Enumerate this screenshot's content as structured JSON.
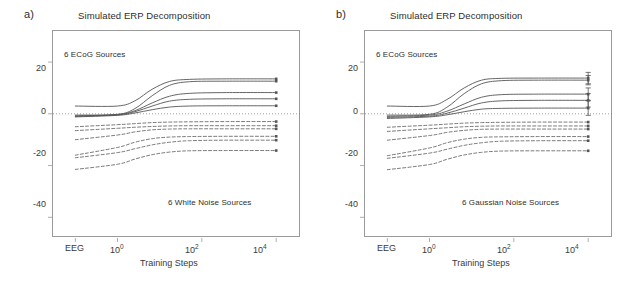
{
  "figure": {
    "panels": [
      {
        "label": "a)",
        "title": "Simulated ERP Decomposition",
        "annotation_top": "6 ECoG Sources",
        "annotation_bottom": "6 White Noise Sources",
        "error_bars": false
      },
      {
        "label": "b)",
        "title": "Simulated ERP Decomposition",
        "annotation_top": "6 ECoG Sources",
        "annotation_bottom": "6 Gaussian Noise Sources",
        "error_bars": true
      }
    ],
    "axes": {
      "yticks": [
        "20",
        "0",
        "-20",
        "-40"
      ],
      "ytick_values": [
        20,
        0,
        -20,
        -40
      ],
      "ylim": [
        -48,
        32
      ],
      "xlabel": "Training Steps",
      "xticks": [
        {
          "text": "EEG",
          "exp": ""
        },
        {
          "text": "10",
          "exp": "0"
        },
        {
          "text": "10",
          "exp": "2"
        },
        {
          "text": "10",
          "exp": "4"
        }
      ],
      "zero_line": "dotted"
    }
  },
  "chart_data": {
    "type": "line",
    "title": "Simulated ERP Decomposition",
    "xlabel": "Training Steps",
    "ylabel": "",
    "ylim": [
      -48,
      32
    ],
    "xlim": [
      0,
      1
    ],
    "grid": false,
    "legend": "none",
    "x_category_labels": [
      "EEG",
      "10^0",
      "10^2",
      "10^4"
    ],
    "x_category_positions": [
      0.09,
      0.26,
      0.6,
      0.9
    ],
    "panels": [
      {
        "name": "a",
        "annotation_top": "6 ECoG Sources",
        "annotation_bottom": "6 White Noise Sources",
        "error_bars": false,
        "series": [
          {
            "name": "ECoG 1",
            "style": "solid",
            "x": [
              0.09,
              0.26,
              0.33,
              0.4,
              0.47,
              0.55,
              0.7,
              0.9
            ],
            "values": [
              3.0,
              3.0,
              5.0,
              9.5,
              12.5,
              13.3,
              13.5,
              13.5
            ],
            "end_value": 13.5
          },
          {
            "name": "ECoG 2",
            "style": "solid",
            "x": [
              0.09,
              0.26,
              0.33,
              0.4,
              0.47,
              0.55,
              0.7,
              0.9
            ],
            "values": [
              -0.5,
              -0.2,
              2.0,
              7.0,
              11.0,
              12.4,
              12.6,
              12.6
            ],
            "end_value": 12.6
          },
          {
            "name": "ECoG 3",
            "style": "solid",
            "x": [
              0.09,
              0.26,
              0.33,
              0.4,
              0.47,
              0.55,
              0.7,
              0.9
            ],
            "values": [
              -0.8,
              -0.3,
              1.2,
              4.2,
              6.8,
              7.9,
              8.2,
              8.2
            ],
            "end_value": 8.2
          },
          {
            "name": "ECoG 4",
            "style": "solid",
            "x": [
              0.09,
              0.26,
              0.33,
              0.4,
              0.47,
              0.55,
              0.7,
              0.9
            ],
            "values": [
              -1.0,
              -0.4,
              0.8,
              3.0,
              4.9,
              5.6,
              5.8,
              5.8
            ],
            "end_value": 5.8
          },
          {
            "name": "ECoG 5",
            "style": "solid",
            "x": [
              0.09,
              0.26,
              0.33,
              0.4,
              0.47,
              0.55,
              0.7,
              0.9
            ],
            "values": [
              -1.2,
              -0.6,
              0.3,
              1.6,
              2.6,
              3.0,
              3.1,
              3.1
            ],
            "end_value": 3.1
          },
          {
            "name": "Noise 1",
            "style": "dashed",
            "x": [
              0.09,
              0.26,
              0.33,
              0.4,
              0.47,
              0.55,
              0.7,
              0.9
            ],
            "values": [
              -5.0,
              -4.2,
              -3.8,
              -3.4,
              -3.2,
              -3.1,
              -3.0,
              -3.0
            ],
            "end_value": -3.0
          },
          {
            "name": "Noise 2",
            "style": "dashed",
            "x": [
              0.09,
              0.26,
              0.33,
              0.4,
              0.47,
              0.55,
              0.7,
              0.9
            ],
            "values": [
              -6.5,
              -5.6,
              -5.2,
              -4.9,
              -4.7,
              -4.6,
              -4.6,
              -4.6
            ],
            "end_value": -4.6
          },
          {
            "name": "Noise 3",
            "style": "dashed",
            "x": [
              0.09,
              0.26,
              0.33,
              0.4,
              0.47,
              0.55,
              0.7,
              0.9
            ],
            "values": [
              -10.0,
              -8.2,
              -7.0,
              -6.2,
              -5.9,
              -5.8,
              -5.8,
              -5.8
            ],
            "end_value": -5.8
          },
          {
            "name": "Noise 4",
            "style": "dashed",
            "x": [
              0.09,
              0.26,
              0.33,
              0.4,
              0.47,
              0.55,
              0.7,
              0.9
            ],
            "values": [
              -16.0,
              -13.0,
              -11.0,
              -9.6,
              -9.0,
              -8.8,
              -8.7,
              -8.7
            ],
            "end_value": -8.7
          },
          {
            "name": "Noise 5",
            "style": "dashed",
            "x": [
              0.09,
              0.26,
              0.33,
              0.4,
              0.47,
              0.55,
              0.7,
              0.9
            ],
            "values": [
              -17.0,
              -15.0,
              -13.5,
              -12.0,
              -11.0,
              -10.4,
              -10.2,
              -10.2
            ],
            "end_value": -10.2
          },
          {
            "name": "Noise 6",
            "style": "dashed",
            "x": [
              0.09,
              0.26,
              0.33,
              0.4,
              0.47,
              0.55,
              0.7,
              0.9
            ],
            "values": [
              -21.5,
              -19.5,
              -17.5,
              -15.8,
              -14.8,
              -14.3,
              -14.2,
              -14.2
            ],
            "end_value": -14.2
          }
        ]
      },
      {
        "name": "b",
        "annotation_top": "6 ECoG Sources",
        "annotation_bottom": "6 Gaussian Noise Sources",
        "error_bars": true,
        "series": [
          {
            "name": "ECoG 1",
            "style": "solid",
            "x": [
              0.09,
              0.26,
              0.33,
              0.4,
              0.47,
              0.55,
              0.7,
              0.9
            ],
            "values": [
              3.0,
              3.0,
              5.5,
              10.0,
              13.0,
              13.7,
              13.8,
              13.8
            ],
            "end_value": 13.8,
            "err": 2.2
          },
          {
            "name": "ECoG 2",
            "style": "solid",
            "x": [
              0.09,
              0.26,
              0.33,
              0.4,
              0.47,
              0.55,
              0.7,
              0.9
            ],
            "values": [
              -0.5,
              -0.2,
              2.5,
              7.8,
              11.6,
              12.8,
              13.0,
              13.0
            ],
            "end_value": 13.0,
            "err": 1.8
          },
          {
            "name": "ECoG 3",
            "style": "solid",
            "x": [
              0.09,
              0.26,
              0.33,
              0.4,
              0.47,
              0.55,
              0.7,
              0.9
            ],
            "values": [
              -1.0,
              -0.5,
              1.0,
              3.8,
              6.4,
              7.4,
              7.6,
              7.6
            ],
            "end_value": 7.6,
            "err": 2.4
          },
          {
            "name": "ECoG 4",
            "style": "solid",
            "x": [
              0.09,
              0.26,
              0.33,
              0.4,
              0.47,
              0.55,
              0.7,
              0.9
            ],
            "values": [
              -1.4,
              -0.9,
              0.2,
              2.2,
              4.2,
              5.0,
              5.2,
              5.2
            ],
            "end_value": 5.2,
            "err": 2.6
          },
          {
            "name": "ECoG 5",
            "style": "solid",
            "x": [
              0.09,
              0.26,
              0.33,
              0.4,
              0.47,
              0.55,
              0.7,
              0.9
            ],
            "values": [
              -1.8,
              -1.2,
              -0.4,
              0.8,
              1.8,
              2.1,
              2.2,
              2.2
            ],
            "end_value": 2.2,
            "err": 2.8
          },
          {
            "name": "Noise 1",
            "style": "dashed",
            "x": [
              0.09,
              0.26,
              0.33,
              0.4,
              0.47,
              0.55,
              0.7,
              0.9
            ],
            "values": [
              -5.2,
              -4.4,
              -4.0,
              -3.6,
              -3.4,
              -3.3,
              -3.2,
              -3.2
            ],
            "end_value": -3.2
          },
          {
            "name": "Noise 2",
            "style": "dashed",
            "x": [
              0.09,
              0.26,
              0.33,
              0.4,
              0.47,
              0.55,
              0.7,
              0.9
            ],
            "values": [
              -6.8,
              -5.8,
              -5.4,
              -5.0,
              -4.8,
              -4.7,
              -4.7,
              -4.7
            ],
            "end_value": -4.7
          },
          {
            "name": "Noise 3",
            "style": "dashed",
            "x": [
              0.09,
              0.26,
              0.33,
              0.4,
              0.47,
              0.55,
              0.7,
              0.9
            ],
            "values": [
              -10.2,
              -8.4,
              -7.2,
              -6.4,
              -6.0,
              -5.9,
              -5.9,
              -5.9
            ],
            "end_value": -5.9
          },
          {
            "name": "Noise 4",
            "style": "dashed",
            "x": [
              0.09,
              0.26,
              0.33,
              0.4,
              0.47,
              0.55,
              0.7,
              0.9
            ],
            "values": [
              -16.2,
              -13.2,
              -11.2,
              -9.8,
              -9.1,
              -8.9,
              -8.8,
              -8.8
            ],
            "end_value": -8.8
          },
          {
            "name": "Noise 5",
            "style": "dashed",
            "x": [
              0.09,
              0.26,
              0.33,
              0.4,
              0.47,
              0.55,
              0.7,
              0.9
            ],
            "values": [
              -17.2,
              -15.2,
              -13.7,
              -12.2,
              -11.2,
              -10.6,
              -10.4,
              -10.4
            ],
            "end_value": -10.4
          },
          {
            "name": "Noise 6",
            "style": "dashed",
            "x": [
              0.09,
              0.26,
              0.33,
              0.4,
              0.47,
              0.55,
              0.7,
              0.9
            ],
            "values": [
              -21.6,
              -19.6,
              -17.6,
              -15.9,
              -14.9,
              -14.4,
              -14.3,
              -14.3
            ],
            "end_value": -14.3
          }
        ]
      }
    ]
  },
  "colors": {
    "frame": "#9a9a9a",
    "text": "#3a3a3a",
    "curve": "#555555",
    "zero_line": "#777777"
  }
}
